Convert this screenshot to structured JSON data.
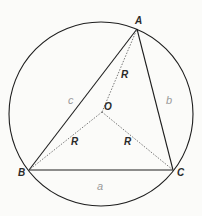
{
  "diagram": {
    "circle": {
      "cx": 101,
      "cy": 114,
      "r": 92
    },
    "points": {
      "A": {
        "label": "A",
        "x": 137,
        "y": 29
      },
      "B": {
        "label": "B",
        "x": 29,
        "y": 170
      },
      "C": {
        "label": "C",
        "x": 173,
        "y": 170
      },
      "O": {
        "label": "O",
        "x": 102,
        "y": 112
      }
    },
    "radius_labels": [
      "R",
      "R",
      "R"
    ],
    "handwritten_marks": [
      "a",
      "b",
      "c"
    ],
    "colors": {
      "stroke": "#1e1e1e",
      "dotted": "#555555",
      "background": "#fbfbf9"
    }
  }
}
